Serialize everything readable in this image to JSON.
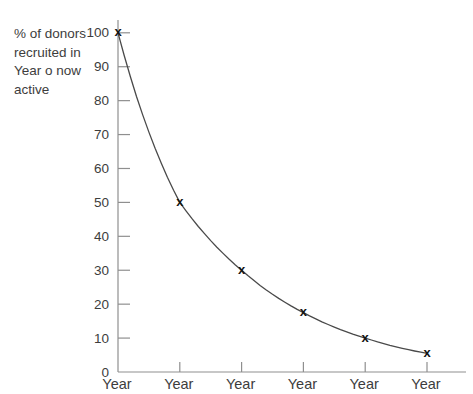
{
  "figure": {
    "background": "#ffffff"
  },
  "colors": {
    "text": "#3d3d3d",
    "axis": "#8f8f8f",
    "curve": "#4a4a4a",
    "marker": "#141414"
  },
  "chart_data": {
    "type": "line",
    "title": "",
    "ylabel_lines": [
      "% of donors",
      "recruited in",
      "Year o now",
      "active"
    ],
    "categories": [
      "Year",
      "Year",
      "Year",
      "Year",
      "Year",
      "Year"
    ],
    "x": [
      0,
      1,
      2,
      3,
      4,
      5
    ],
    "values": [
      100,
      50,
      30,
      17.5,
      10,
      5.5
    ],
    "marker_glyph": "x",
    "ylim": [
      0,
      100
    ],
    "yticks": [
      0,
      10,
      20,
      30,
      40,
      50,
      60,
      70,
      80,
      90,
      100
    ],
    "grid": false,
    "legend": "none",
    "tick_direction": "in"
  }
}
